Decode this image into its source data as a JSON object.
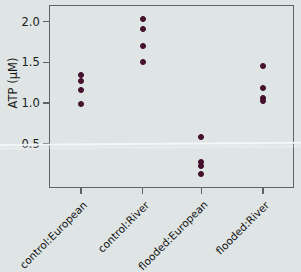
{
  "chart_data": {
    "type": "scatter",
    "title": "",
    "xlabel": "",
    "ylabel": "ATP  (µM)",
    "categories": [
      "control:European",
      "control:River",
      "flooded:European",
      "flooded:River"
    ],
    "ytick_labels": [
      "2.0",
      "1.5",
      "1.0",
      "0.5"
    ],
    "ytick_values": [
      2.0,
      1.5,
      1.0,
      0.5
    ],
    "ylim": [
      0.0,
      2.16
    ],
    "grid": false,
    "legend": "none",
    "marker_color": "#4c1030",
    "background_color": "#dfe5e5",
    "frame_color": "#5b6566",
    "series": [
      {
        "name": "control:European",
        "category": "control:European",
        "values": [
          1.35,
          1.27,
          1.16,
          0.99
        ]
      },
      {
        "name": "control:River",
        "category": "control:River",
        "values": [
          2.03,
          1.91,
          1.7,
          1.5
        ]
      },
      {
        "name": "flooded:European",
        "category": "flooded:European",
        "values": [
          0.58,
          0.28,
          0.22,
          0.13
        ]
      },
      {
        "name": "flooded:River",
        "category": "flooded:River",
        "values": [
          1.45,
          1.18,
          1.06,
          1.03
        ]
      }
    ]
  },
  "axes": {
    "y_title": "ATP  (µM)",
    "y_ticks": [
      {
        "label": "2.0",
        "value": 2.0
      },
      {
        "label": "1.5",
        "value": 1.5
      },
      {
        "label": "1.0",
        "value": 1.0
      },
      {
        "label": "0.5",
        "value": 0.5
      }
    ],
    "x_ticks": [
      {
        "label": "control:European"
      },
      {
        "label": "control:River"
      },
      {
        "label": "flooded:European"
      },
      {
        "label": "flooded:River"
      }
    ]
  }
}
